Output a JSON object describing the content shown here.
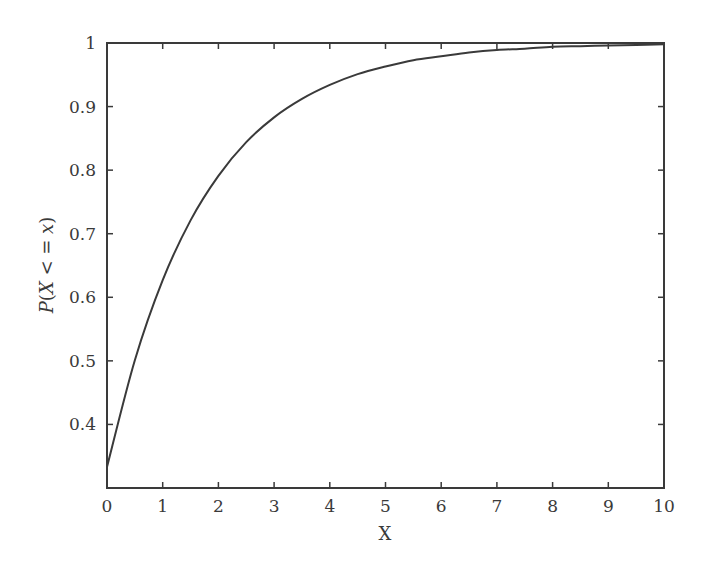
{
  "chart_data": {
    "type": "line",
    "title": "",
    "xlabel": "X",
    "ylabel": "P(X <= x)",
    "ylabel_parts": {
      "p": "P",
      "open": "(",
      "X": "X",
      "op": " < = ",
      "x": "x",
      "close": ")"
    },
    "xlim": [
      0,
      10
    ],
    "ylim": [
      0.3,
      1.0
    ],
    "grid": false,
    "legend": null,
    "x_ticks": [
      0,
      1,
      2,
      3,
      4,
      5,
      6,
      7,
      8,
      9,
      10
    ],
    "x_tick_labels": [
      "0",
      "1",
      "2",
      "3",
      "4",
      "5",
      "6",
      "7",
      "8",
      "9",
      "10"
    ],
    "y_ticks": [
      0.4,
      0.5,
      0.6,
      0.7,
      0.8,
      0.9,
      1.0
    ],
    "y_tick_labels": [
      "0.4",
      "0.5",
      "0.6",
      "0.7",
      "0.8",
      "0.9",
      "1"
    ],
    "series": [
      {
        "name": "CDF",
        "color": "#3a3a3a",
        "x": [
          0,
          0.5,
          1,
          1.5,
          2,
          2.5,
          3,
          3.5,
          4,
          4.5,
          5,
          5.5,
          6,
          6.5,
          7,
          7.5,
          8,
          8.5,
          9,
          9.5,
          10
        ],
        "values": [
          0.333,
          0.501,
          0.627,
          0.721,
          0.791,
          0.844,
          0.883,
          0.912,
          0.934,
          0.951,
          0.963,
          0.973,
          0.979,
          0.985,
          0.989,
          0.991,
          0.994,
          0.995,
          0.996,
          0.997,
          0.998
        ]
      }
    ]
  },
  "colors": {
    "axis": "#3a3a3a",
    "line": "#3a3a3a",
    "background": "#ffffff"
  }
}
